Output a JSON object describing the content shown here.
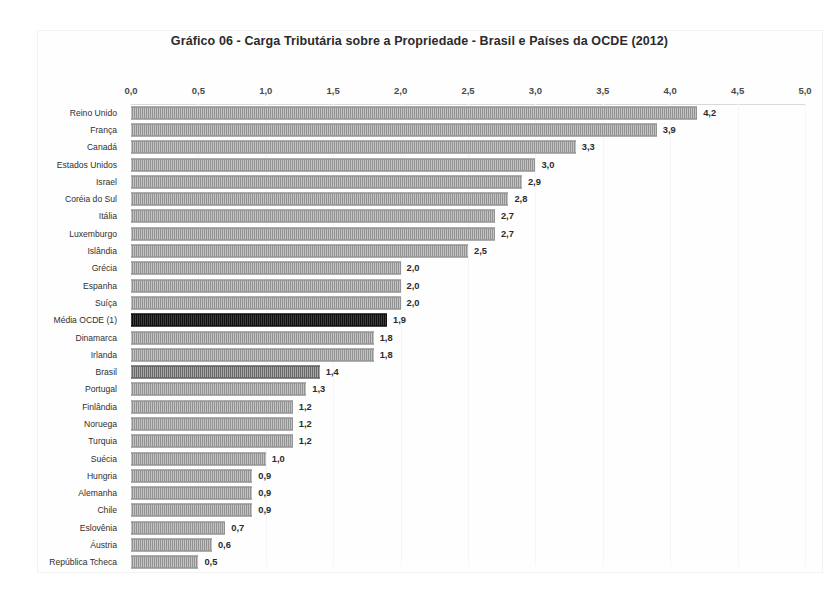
{
  "chart_data": {
    "type": "bar",
    "orientation": "horizontal",
    "title": "Gráfico 06 - Carga Tributária sobre a Propriedade - Brasil e Países da OCDE (2012)",
    "xlabel": "",
    "ylabel": "",
    "xlim": [
      0,
      5
    ],
    "xticks": [
      "0,0",
      "0,5",
      "1,0",
      "1,5",
      "2,0",
      "2,5",
      "3,0",
      "3,5",
      "4,0",
      "4,5",
      "5,0"
    ],
    "xtick_values": [
      0,
      0.5,
      1.0,
      1.5,
      2.0,
      2.5,
      3.0,
      3.5,
      4.0,
      4.5,
      5.0
    ],
    "grid": true,
    "legend": "none",
    "categories": [
      "Reino Unido",
      "França",
      "Canadá",
      "Estados Unidos",
      "Israel",
      "Coréia do Sul",
      "Itália",
      "Luxemburgo",
      "Islândia",
      "Grécia",
      "Espanha",
      "Suíça",
      "Média OCDE (1)",
      "Dinamarca",
      "Irlanda",
      "Brasil",
      "Portugal",
      "Finlândia",
      "Noruega",
      "Turquia",
      "Suécia",
      "Hungria",
      "Alemanha",
      "Chile",
      "Eslovênia",
      "Áustria",
      "República Tcheca"
    ],
    "values": [
      4.2,
      3.9,
      3.3,
      3.0,
      2.9,
      2.8,
      2.7,
      2.7,
      2.5,
      2.0,
      2.0,
      2.0,
      1.9,
      1.8,
      1.8,
      1.4,
      1.3,
      1.2,
      1.2,
      1.2,
      1.0,
      0.9,
      0.9,
      0.9,
      0.7,
      0.6,
      0.5
    ],
    "value_labels": [
      "4,2",
      "3,9",
      "3,3",
      "3,0",
      "2,9",
      "2,8",
      "2,7",
      "2,7",
      "2,5",
      "2,0",
      "2,0",
      "2,0",
      "1,9",
      "1,8",
      "1,8",
      "1,4",
      "1,3",
      "1,2",
      "1,2",
      "1,2",
      "1,0",
      "0,9",
      "0,9",
      "0,9",
      "0,7",
      "0,6",
      "0,5"
    ],
    "bar_styles": [
      "normal",
      "normal",
      "normal",
      "normal",
      "normal",
      "normal",
      "normal",
      "normal",
      "normal",
      "normal",
      "normal",
      "normal",
      "average",
      "normal",
      "normal",
      "highlight",
      "normal",
      "normal",
      "normal",
      "normal",
      "normal",
      "normal",
      "normal",
      "normal",
      "normal",
      "normal",
      "normal"
    ],
    "colors": {
      "bar": "#9b9b9b",
      "highlight": "#6e6e6e",
      "average": "#141414",
      "text": "#2b2b2b",
      "grid": "#f6f6f6",
      "background": "#ffffff"
    }
  }
}
